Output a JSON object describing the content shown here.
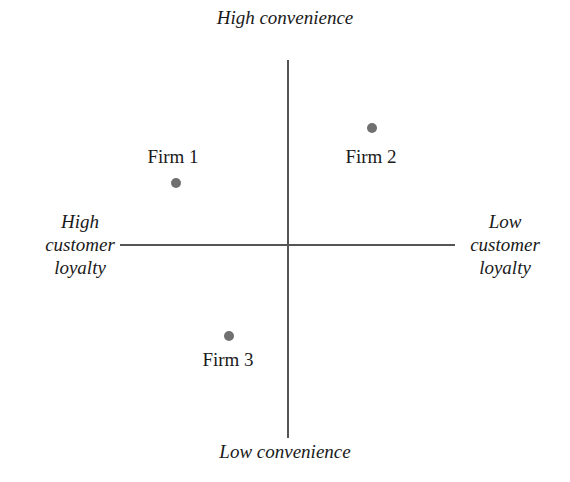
{
  "diagram": {
    "axes": {
      "top": "High convenience",
      "bottom": "Low convenience",
      "left": [
        "High",
        "customer",
        "loyalty"
      ],
      "right": [
        "Low",
        "customer",
        "loyalty"
      ]
    },
    "firms": [
      {
        "label": "Firm 1",
        "quadrant": "high convenience / high customer loyalty"
      },
      {
        "label": "Firm 2",
        "quadrant": "high convenience / low customer loyalty"
      },
      {
        "label": "Firm 3",
        "quadrant": "low convenience / high customer loyalty"
      }
    ],
    "colors": {
      "axis": "#555555",
      "point": "#707070",
      "text": "#1a1a1a"
    }
  }
}
